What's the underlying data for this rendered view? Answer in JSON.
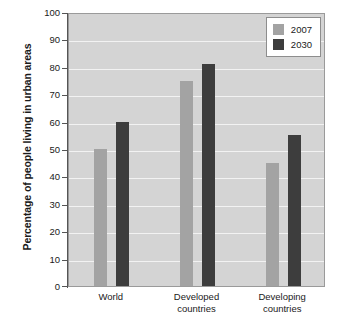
{
  "chart_data": {
    "type": "bar",
    "title": "",
    "xlabel": "",
    "ylabel": "Percentage of people living in urban areas",
    "categories": [
      "World",
      "Developed countries",
      "Developing countries"
    ],
    "series": [
      {
        "name": "2007",
        "color": "#a3a3a3",
        "values": [
          50,
          75,
          45
        ]
      },
      {
        "name": "2030",
        "color": "#3d3d3d",
        "values": [
          60,
          81,
          55
        ]
      }
    ],
    "ylim": [
      0,
      100
    ],
    "yticks": [
      0,
      10,
      20,
      30,
      40,
      50,
      60,
      70,
      80,
      90,
      100
    ],
    "ytick_labels": [
      "0",
      "10",
      "20",
      "30",
      "40",
      "50",
      "60",
      "70",
      "80",
      "90",
      "100"
    ],
    "grid": true,
    "grid_axis": "y",
    "grid_color": "#f2f2f2",
    "legend_position": "top-right",
    "plot_background": "#d4d4d4",
    "figure_background": "#ffffff",
    "axis_color": "#555555"
  },
  "legend": {
    "items": [
      {
        "label": "2007",
        "color": "#a3a3a3"
      },
      {
        "label": "2030",
        "color": "#3d3d3d"
      }
    ]
  },
  "x_labels": [
    {
      "text": "World"
    },
    {
      "text": "Developed\ncountries"
    },
    {
      "text": "Developing\ncountries"
    }
  ]
}
